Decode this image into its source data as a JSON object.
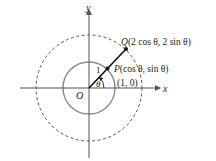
{
  "diagram": {
    "axes": {
      "x_label": "x",
      "y_label": "y",
      "origin_label": "O"
    },
    "circles": [
      {
        "name": "unit-circle",
        "radius_units": 1,
        "style": "solid",
        "color": "#8a8a8a"
      },
      {
        "name": "radius-2-circle",
        "radius_units": 2,
        "style": "dashed",
        "color": "#555555"
      }
    ],
    "points": {
      "P": {
        "name": "P",
        "coords_text": "(cos θ, sin θ)",
        "prefix": "P"
      },
      "Q": {
        "name": "Q",
        "coords_text": "(2 cos θ, 2 sin θ)",
        "prefix": "Q"
      },
      "unit_point": {
        "label": "(1, 0)"
      }
    },
    "segment_label": "1",
    "angle_label": "θ",
    "colors": {
      "axis": "#555555",
      "ray": "#111111",
      "text": "#222222"
    }
  }
}
